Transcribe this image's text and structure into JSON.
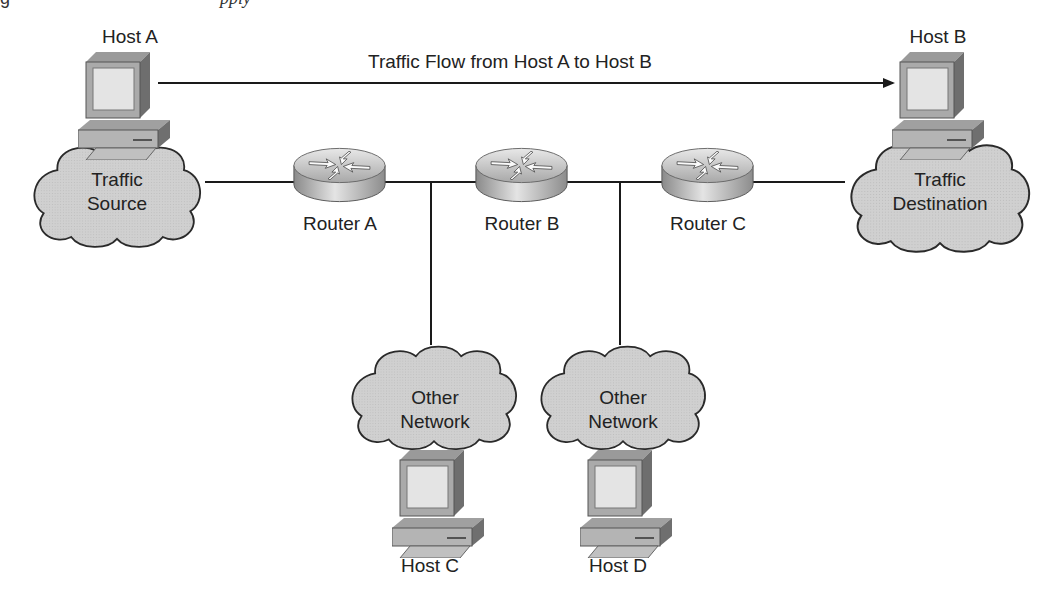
{
  "caption_fragment": {
    "prefix": "g",
    "italic": "pply"
  },
  "flow": {
    "label": "Traffic Flow from Host A to Host B"
  },
  "hosts": [
    {
      "id": "A",
      "label": "Host A"
    },
    {
      "id": "B",
      "label": "Host B"
    },
    {
      "id": "C",
      "label": "Host C"
    },
    {
      "id": "D",
      "label": "Host D"
    }
  ],
  "routers": [
    {
      "id": "A",
      "label": "Router A"
    },
    {
      "id": "B",
      "label": "Router B"
    },
    {
      "id": "C",
      "label": "Router C"
    }
  ],
  "clouds": {
    "source": {
      "line1": "Traffic",
      "line2": "Source"
    },
    "destination": {
      "line1": "Traffic",
      "line2": "Destination"
    },
    "other1": {
      "line1": "Other",
      "line2": "Network"
    },
    "other2": {
      "line1": "Other",
      "line2": "Network"
    }
  },
  "colors": {
    "cloud": "#cfcfcf",
    "line": "#1a1a1a",
    "device": "#b5b5b5",
    "screen": "#e2e2e2"
  }
}
